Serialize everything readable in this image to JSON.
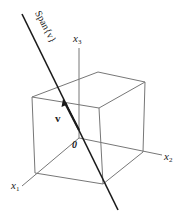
{
  "figure": {
    "span_label": "Span{v}",
    "vector_label": "v",
    "origin_label": "0",
    "axes": {
      "x1": {
        "base": "x",
        "sub": "1"
      },
      "x2": {
        "base": "x",
        "sub": "2"
      },
      "x3": {
        "base": "x",
        "sub": "3"
      }
    },
    "colors": {
      "cube_lines": "#777777",
      "span_line": "#1a1a1a",
      "text": "#222222"
    }
  }
}
